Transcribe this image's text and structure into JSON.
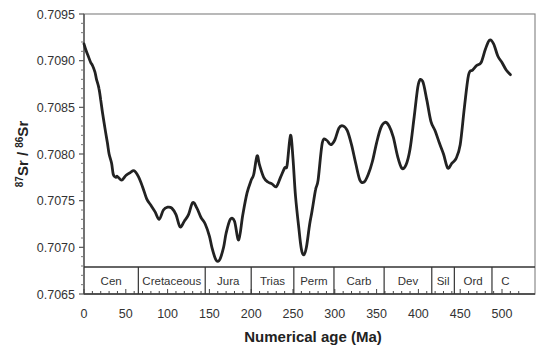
{
  "chart_data": {
    "type": "line",
    "title": "",
    "xlabel": "Numerical age (Ma)",
    "ylabel": "87Sr / 86Sr",
    "ylabel_parts": {
      "sup1": "87",
      "base1": "Sr / ",
      "sup2": "86",
      "base2": "Sr"
    },
    "xlim": [
      0,
      520
    ],
    "ylim": [
      0.7065,
      0.7095
    ],
    "xticks": [
      0,
      50,
      100,
      150,
      200,
      250,
      300,
      350,
      400,
      450,
      500
    ],
    "yticks": [
      "0.7065",
      "0.7070",
      "0.7075",
      "0.7080",
      "0.7085",
      "0.7090",
      "0.7095"
    ],
    "grid": false,
    "legend": null,
    "line_color": "#222222",
    "periods": [
      {
        "label": "Cen",
        "start": 0,
        "end": 65
      },
      {
        "label": "Cretaceous",
        "start": 65,
        "end": 145
      },
      {
        "label": "Jura",
        "start": 145,
        "end": 200
      },
      {
        "label": "Trias",
        "start": 200,
        "end": 251
      },
      {
        "label": "Perm",
        "start": 251,
        "end": 299
      },
      {
        "label": "Carb",
        "start": 299,
        "end": 359
      },
      {
        "label": "Dev",
        "start": 359,
        "end": 416
      },
      {
        "label": "Sil",
        "start": 416,
        "end": 443
      },
      {
        "label": "Ord",
        "start": 443,
        "end": 488
      },
      {
        "label": "C",
        "start": 488,
        "end": 520
      }
    ],
    "series": [
      {
        "name": "Seawater 87Sr/86Sr",
        "x": [
          0,
          2,
          5,
          8,
          10,
          13,
          15,
          18,
          20,
          22,
          25,
          28,
          30,
          33,
          35,
          38,
          40,
          45,
          50,
          55,
          60,
          65,
          70,
          75,
          80,
          85,
          90,
          95,
          100,
          105,
          110,
          115,
          120,
          125,
          130,
          135,
          140,
          145,
          150,
          153,
          157,
          160,
          163,
          167,
          170,
          175,
          180,
          185,
          190,
          195,
          200,
          203,
          207,
          210,
          215,
          220,
          225,
          230,
          235,
          240,
          243,
          247,
          250,
          253,
          257,
          260,
          263,
          266,
          270,
          273,
          277,
          280,
          285,
          290,
          295,
          300,
          305,
          310,
          315,
          320,
          325,
          330,
          335,
          340,
          345,
          350,
          355,
          360,
          365,
          370,
          375,
          380,
          385,
          390,
          395,
          400,
          405,
          410,
          415,
          420,
          425,
          430,
          435,
          440,
          445,
          450,
          455,
          460,
          465,
          470,
          475,
          480,
          485,
          490,
          495,
          500,
          505,
          510
        ],
        "y": [
          0.70918,
          0.70912,
          0.70905,
          0.70898,
          0.70895,
          0.70888,
          0.7088,
          0.7087,
          0.70858,
          0.70845,
          0.70828,
          0.70812,
          0.708,
          0.7079,
          0.70778,
          0.70775,
          0.70776,
          0.70772,
          0.70777,
          0.7078,
          0.70782,
          0.70776,
          0.70765,
          0.70752,
          0.70745,
          0.70738,
          0.7073,
          0.7074,
          0.70743,
          0.70742,
          0.70735,
          0.70722,
          0.70728,
          0.70735,
          0.70748,
          0.70742,
          0.70732,
          0.70725,
          0.70712,
          0.707,
          0.70688,
          0.70685,
          0.70688,
          0.707,
          0.70715,
          0.7073,
          0.70728,
          0.70708,
          0.70735,
          0.70758,
          0.70772,
          0.70778,
          0.70798,
          0.70788,
          0.70775,
          0.7077,
          0.70768,
          0.70765,
          0.70775,
          0.70785,
          0.70788,
          0.7082,
          0.70795,
          0.70755,
          0.7072,
          0.70698,
          0.70692,
          0.707,
          0.70725,
          0.7074,
          0.70762,
          0.70772,
          0.70812,
          0.70815,
          0.7081,
          0.70815,
          0.70828,
          0.7083,
          0.70825,
          0.7081,
          0.7079,
          0.70772,
          0.7077,
          0.70778,
          0.70792,
          0.70812,
          0.70828,
          0.70834,
          0.7083,
          0.70818,
          0.70798,
          0.70785,
          0.70788,
          0.70805,
          0.7084,
          0.70875,
          0.70878,
          0.70858,
          0.70835,
          0.70825,
          0.70812,
          0.708,
          0.70785,
          0.7079,
          0.70795,
          0.7081,
          0.7085,
          0.70885,
          0.7089,
          0.70895,
          0.70898,
          0.70912,
          0.70922,
          0.70918,
          0.70905,
          0.70898,
          0.7089,
          0.70885
        ]
      }
    ]
  }
}
